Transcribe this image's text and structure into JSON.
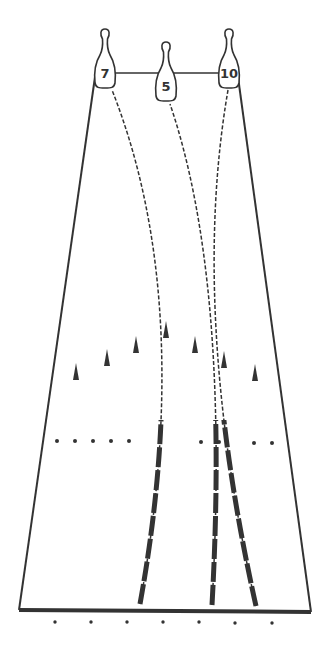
{
  "diagram": {
    "title": "",
    "colors": {
      "ink": "#333333",
      "background": "#ffffff"
    },
    "pins": [
      {
        "label": "7",
        "x": 105,
        "y": 73
      },
      {
        "label": "5",
        "x": 166,
        "y": 86
      },
      {
        "label": "10",
        "x": 229,
        "y": 73
      }
    ],
    "lane": {
      "top_left": [
        95,
        73
      ],
      "top_right": [
        238,
        73
      ],
      "bottom_left": [
        19,
        610
      ],
      "bottom_right": [
        311,
        612
      ]
    },
    "paths": [
      {
        "to_pin": "7",
        "start": [
          140,
          604
        ],
        "ctrl": [
          195,
          300
        ],
        "end": [
          112,
          90
        ]
      },
      {
        "to_pin": "5",
        "start": [
          212,
          605
        ],
        "ctrl": [
          230,
          280
        ],
        "end": [
          170,
          104
        ]
      },
      {
        "to_pin": "10",
        "start": [
          256,
          606
        ],
        "ctrl": [
          190,
          310
        ],
        "end": [
          228,
          90
        ]
      }
    ],
    "arrows": [
      [
        76,
        372
      ],
      [
        107,
        358
      ],
      [
        136,
        345
      ],
      [
        166,
        330
      ],
      [
        195,
        345
      ],
      [
        224,
        360
      ],
      [
        255,
        373
      ]
    ],
    "range_dots": [
      [
        57,
        441
      ],
      [
        75,
        441
      ],
      [
        93,
        441
      ],
      [
        111,
        441
      ],
      [
        129,
        441
      ],
      [
        201,
        442
      ],
      [
        219,
        442
      ],
      [
        254,
        443
      ],
      [
        272,
        443
      ]
    ],
    "foul_line_dots": [
      [
        55,
        622
      ],
      [
        91,
        622
      ],
      [
        127,
        622
      ],
      [
        163,
        622
      ],
      [
        199,
        622
      ],
      [
        235,
        623
      ],
      [
        272,
        623
      ]
    ]
  }
}
